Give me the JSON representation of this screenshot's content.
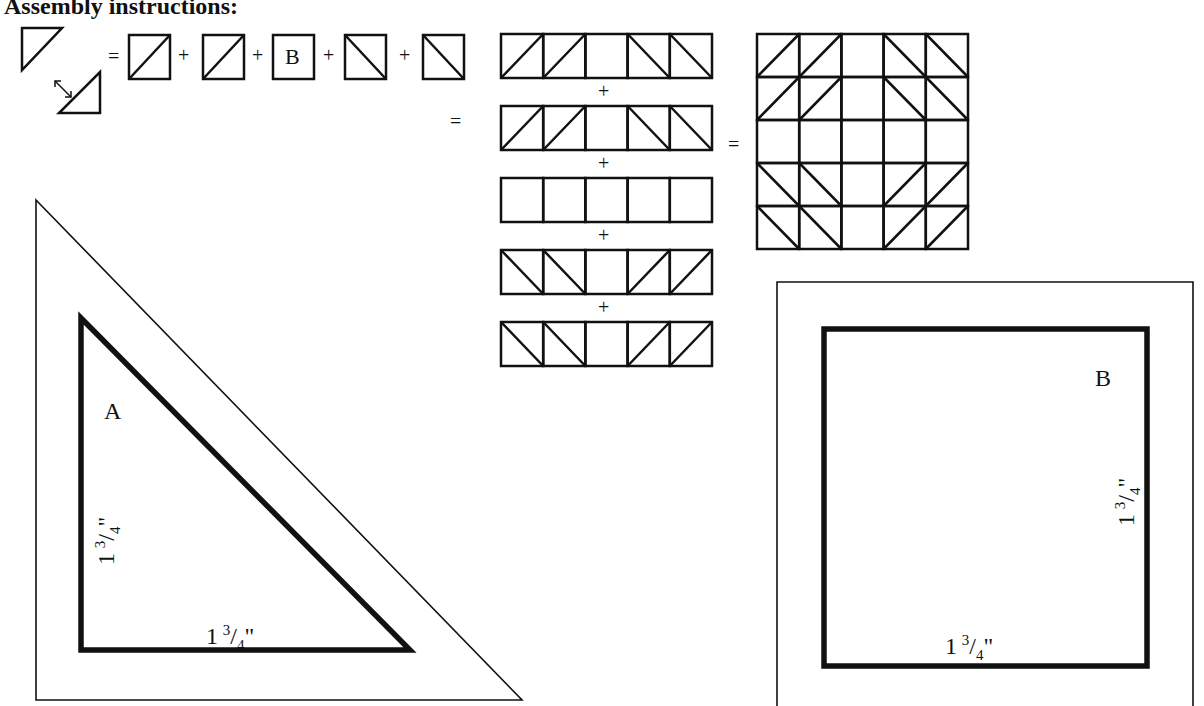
{
  "title": "Assembly instructions:",
  "formula": {
    "equals": "=",
    "plus": "+",
    "swap_arrow": "↔",
    "center_square_label": "B"
  },
  "rows": [
    {
      "cells": [
        "ur",
        "ur",
        "blank",
        "dr",
        "dr"
      ]
    },
    {
      "cells": [
        "ur",
        "ur",
        "blank",
        "dr",
        "dr"
      ]
    },
    {
      "cells": [
        "blank",
        "blank",
        "blank",
        "blank",
        "blank"
      ]
    },
    {
      "cells": [
        "dr",
        "dr",
        "blank",
        "ur",
        "ur"
      ]
    },
    {
      "cells": [
        "dr",
        "dr",
        "blank",
        "ur",
        "ur"
      ]
    }
  ],
  "row_plus": "+",
  "rows_equals": "=",
  "block_equals": "=",
  "template_a": {
    "label": "A",
    "side_vertical": {
      "whole": "1",
      "num": "3",
      "den": "4",
      "unit": "\""
    },
    "side_horizontal": {
      "whole": "1",
      "num": "3",
      "den": "4",
      "unit": "\""
    }
  },
  "template_b": {
    "label": "B",
    "side_vertical": {
      "whole": "1",
      "num": "3",
      "den": "4",
      "unit": "\""
    },
    "side_horizontal": {
      "whole": "1",
      "num": "3",
      "den": "4",
      "unit": "\""
    }
  }
}
